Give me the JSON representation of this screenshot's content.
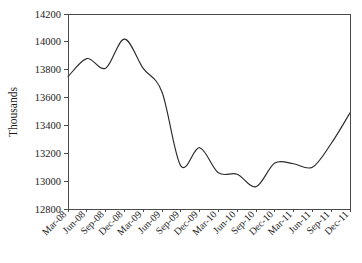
{
  "chart_data": {
    "type": "line",
    "title": "",
    "subtitle": "",
    "xlabel": "",
    "ylabel": "Thousands",
    "ylim": [
      12800,
      14200
    ],
    "ytick_step": 200,
    "yticks": [
      "12800",
      "13000",
      "13200",
      "13400",
      "13600",
      "13800",
      "14000",
      "14200"
    ],
    "grid": false,
    "legend": false,
    "legend_position": "none",
    "line_color": "#2b2b2b",
    "axis_color": "#4a4a4a",
    "background_color": "#ffffff",
    "markers": false,
    "smoothing": "spline",
    "categories": [
      "Mar-08",
      "Jun-08",
      "Sep-08",
      "Dec-08",
      "Mar-09",
      "Jun-09",
      "Sep-09",
      "Dec-09",
      "Mar-10",
      "Jun-10",
      "Sep-10",
      "Dec-10",
      "Mar-11",
      "Jun-11",
      "Sep-11",
      "Dec-11"
    ],
    "series": [
      {
        "name": "Thousands",
        "values": [
          13750,
          13880,
          13810,
          14020,
          13810,
          13640,
          13110,
          13240,
          13060,
          13050,
          12960,
          13130,
          13125,
          13100,
          13270,
          13490
        ]
      }
    ],
    "annotations": []
  }
}
